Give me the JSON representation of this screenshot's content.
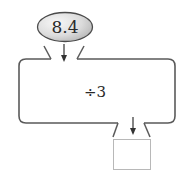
{
  "diagram": {
    "type": "function-machine",
    "input": {
      "value": "8.4",
      "shape": "ellipse",
      "fill_light": "#f4f4f4",
      "fill_dark": "#bdbdbd"
    },
    "machine": {
      "operation": "÷3",
      "border_color": "#5a5a5a"
    },
    "output": {
      "value": "",
      "shape": "empty-box",
      "border_color": "#b8b8b8"
    },
    "arrows": [
      {
        "from": "input",
        "to": "machine",
        "direction": "down"
      },
      {
        "from": "machine",
        "to": "output",
        "direction": "down"
      }
    ]
  }
}
